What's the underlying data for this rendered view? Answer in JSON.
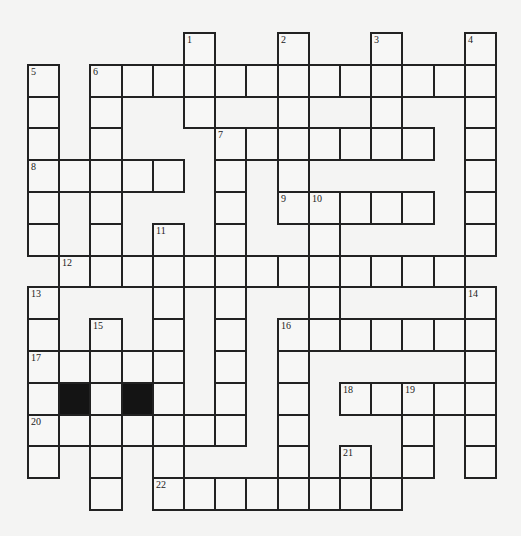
{
  "puzzle": {
    "type": "crossword",
    "origin": {
      "x": 28,
      "y": 33
    },
    "cell_size": {
      "w": 31.2,
      "h": 31.8
    },
    "cols": 15,
    "rows": 15,
    "colors": {
      "line": "#222222",
      "cell": "#f7f7f6",
      "black": "#141414",
      "background": "#f4f4f3"
    },
    "cells": [
      {
        "r": 0,
        "c": 5,
        "n": "1"
      },
      {
        "r": 0,
        "c": 8,
        "n": "2"
      },
      {
        "r": 0,
        "c": 11,
        "n": "3"
      },
      {
        "r": 0,
        "c": 14,
        "n": "4"
      },
      {
        "r": 1,
        "c": 0,
        "n": "5"
      },
      {
        "r": 1,
        "c": 2,
        "n": "6"
      },
      {
        "r": 1,
        "c": 3
      },
      {
        "r": 1,
        "c": 4
      },
      {
        "r": 1,
        "c": 5
      },
      {
        "r": 1,
        "c": 6
      },
      {
        "r": 1,
        "c": 7
      },
      {
        "r": 1,
        "c": 8
      },
      {
        "r": 1,
        "c": 9
      },
      {
        "r": 1,
        "c": 10
      },
      {
        "r": 1,
        "c": 11
      },
      {
        "r": 1,
        "c": 12
      },
      {
        "r": 1,
        "c": 13
      },
      {
        "r": 1,
        "c": 14
      },
      {
        "r": 2,
        "c": 0
      },
      {
        "r": 2,
        "c": 2
      },
      {
        "r": 2,
        "c": 5
      },
      {
        "r": 2,
        "c": 8
      },
      {
        "r": 2,
        "c": 11
      },
      {
        "r": 2,
        "c": 14
      },
      {
        "r": 3,
        "c": 0
      },
      {
        "r": 3,
        "c": 2
      },
      {
        "r": 3,
        "c": 6,
        "n": "7"
      },
      {
        "r": 3,
        "c": 7
      },
      {
        "r": 3,
        "c": 8
      },
      {
        "r": 3,
        "c": 9
      },
      {
        "r": 3,
        "c": 10
      },
      {
        "r": 3,
        "c": 11
      },
      {
        "r": 3,
        "c": 12
      },
      {
        "r": 3,
        "c": 14
      },
      {
        "r": 4,
        "c": 0,
        "n": "8"
      },
      {
        "r": 4,
        "c": 1
      },
      {
        "r": 4,
        "c": 2
      },
      {
        "r": 4,
        "c": 3
      },
      {
        "r": 4,
        "c": 4
      },
      {
        "r": 4,
        "c": 6
      },
      {
        "r": 4,
        "c": 8
      },
      {
        "r": 4,
        "c": 14
      },
      {
        "r": 5,
        "c": 0
      },
      {
        "r": 5,
        "c": 2
      },
      {
        "r": 5,
        "c": 6
      },
      {
        "r": 5,
        "c": 8,
        "n": "9"
      },
      {
        "r": 5,
        "c": 9,
        "n": "10"
      },
      {
        "r": 5,
        "c": 10
      },
      {
        "r": 5,
        "c": 11
      },
      {
        "r": 5,
        "c": 12
      },
      {
        "r": 5,
        "c": 14
      },
      {
        "r": 6,
        "c": 0
      },
      {
        "r": 6,
        "c": 2
      },
      {
        "r": 6,
        "c": 4,
        "n": "11"
      },
      {
        "r": 6,
        "c": 6
      },
      {
        "r": 6,
        "c": 9
      },
      {
        "r": 6,
        "c": 14
      },
      {
        "r": 7,
        "c": 1,
        "n": "12"
      },
      {
        "r": 7,
        "c": 2
      },
      {
        "r": 7,
        "c": 3
      },
      {
        "r": 7,
        "c": 4
      },
      {
        "r": 7,
        "c": 5
      },
      {
        "r": 7,
        "c": 6
      },
      {
        "r": 7,
        "c": 7
      },
      {
        "r": 7,
        "c": 8
      },
      {
        "r": 7,
        "c": 9
      },
      {
        "r": 7,
        "c": 10
      },
      {
        "r": 7,
        "c": 11
      },
      {
        "r": 7,
        "c": 12
      },
      {
        "r": 7,
        "c": 13
      },
      {
        "r": 8,
        "c": 0,
        "n": "13"
      },
      {
        "r": 8,
        "c": 4
      },
      {
        "r": 8,
        "c": 6
      },
      {
        "r": 8,
        "c": 9
      },
      {
        "r": 8,
        "c": 14,
        "n": "14"
      },
      {
        "r": 9,
        "c": 0
      },
      {
        "r": 9,
        "c": 2,
        "n": "15"
      },
      {
        "r": 9,
        "c": 4
      },
      {
        "r": 9,
        "c": 6
      },
      {
        "r": 9,
        "c": 8,
        "n": "16"
      },
      {
        "r": 9,
        "c": 9
      },
      {
        "r": 9,
        "c": 10
      },
      {
        "r": 9,
        "c": 11
      },
      {
        "r": 9,
        "c": 12
      },
      {
        "r": 9,
        "c": 13
      },
      {
        "r": 9,
        "c": 14
      },
      {
        "r": 10,
        "c": 0,
        "n": "17"
      },
      {
        "r": 10,
        "c": 1
      },
      {
        "r": 10,
        "c": 2
      },
      {
        "r": 10,
        "c": 3
      },
      {
        "r": 10,
        "c": 4
      },
      {
        "r": 10,
        "c": 6
      },
      {
        "r": 10,
        "c": 8
      },
      {
        "r": 10,
        "c": 14
      },
      {
        "r": 11,
        "c": 0
      },
      {
        "r": 11,
        "c": 1,
        "black": true
      },
      {
        "r": 11,
        "c": 2
      },
      {
        "r": 11,
        "c": 3,
        "black": true
      },
      {
        "r": 11,
        "c": 4
      },
      {
        "r": 11,
        "c": 6
      },
      {
        "r": 11,
        "c": 8
      },
      {
        "r": 11,
        "c": 10,
        "n": "18"
      },
      {
        "r": 11,
        "c": 11
      },
      {
        "r": 11,
        "c": 12,
        "n": "19"
      },
      {
        "r": 11,
        "c": 13
      },
      {
        "r": 11,
        "c": 14
      },
      {
        "r": 12,
        "c": 0,
        "n": "20"
      },
      {
        "r": 12,
        "c": 1
      },
      {
        "r": 12,
        "c": 2
      },
      {
        "r": 12,
        "c": 3
      },
      {
        "r": 12,
        "c": 4
      },
      {
        "r": 12,
        "c": 5
      },
      {
        "r": 12,
        "c": 6
      },
      {
        "r": 12,
        "c": 8
      },
      {
        "r": 12,
        "c": 12
      },
      {
        "r": 12,
        "c": 14
      },
      {
        "r": 13,
        "c": 0
      },
      {
        "r": 13,
        "c": 2
      },
      {
        "r": 13,
        "c": 4
      },
      {
        "r": 13,
        "c": 8
      },
      {
        "r": 13,
        "c": 10,
        "n": "21"
      },
      {
        "r": 13,
        "c": 12
      },
      {
        "r": 13,
        "c": 14
      },
      {
        "r": 14,
        "c": 2
      },
      {
        "r": 14,
        "c": 4,
        "n": "22"
      },
      {
        "r": 14,
        "c": 5
      },
      {
        "r": 14,
        "c": 6
      },
      {
        "r": 14,
        "c": 7
      },
      {
        "r": 14,
        "c": 8
      },
      {
        "r": 14,
        "c": 9
      },
      {
        "r": 14,
        "c": 10
      },
      {
        "r": 14,
        "c": 11
      }
    ],
    "entries": {
      "across": [
        {
          "number": "6",
          "row": 1,
          "col": 2,
          "length": 13
        },
        {
          "number": "7",
          "row": 3,
          "col": 6,
          "length": 7
        },
        {
          "number": "8",
          "row": 4,
          "col": 0,
          "length": 5
        },
        {
          "number": "9",
          "row": 5,
          "col": 8,
          "length": 5
        },
        {
          "number": "12",
          "row": 7,
          "col": 1,
          "length": 13
        },
        {
          "number": "16",
          "row": 9,
          "col": 8,
          "length": 7
        },
        {
          "number": "17",
          "row": 10,
          "col": 0,
          "length": 5
        },
        {
          "number": "18",
          "row": 11,
          "col": 10,
          "length": 5
        },
        {
          "number": "20",
          "row": 12,
          "col": 0,
          "length": 7
        },
        {
          "number": "22",
          "row": 14,
          "col": 4,
          "length": 8
        }
      ],
      "down": [
        {
          "number": "1",
          "row": 0,
          "col": 5,
          "length": 3
        },
        {
          "number": "2",
          "row": 0,
          "col": 8,
          "length": 6
        },
        {
          "number": "3",
          "row": 0,
          "col": 11,
          "length": 4
        },
        {
          "number": "4",
          "row": 0,
          "col": 14,
          "length": 7
        },
        {
          "number": "5",
          "row": 1,
          "col": 0,
          "length": 6
        },
        {
          "number": "6",
          "row": 1,
          "col": 2,
          "length": 7
        },
        {
          "number": "7",
          "row": 3,
          "col": 6,
          "length": 10
        },
        {
          "number": "10",
          "row": 5,
          "col": 9,
          "length": 5
        },
        {
          "number": "11",
          "row": 6,
          "col": 4,
          "length": 9
        },
        {
          "number": "13",
          "row": 8,
          "col": 0,
          "length": 6
        },
        {
          "number": "14",
          "row": 8,
          "col": 14,
          "length": 6
        },
        {
          "number": "15",
          "row": 9,
          "col": 2,
          "length": 6
        },
        {
          "number": "16",
          "row": 9,
          "col": 8,
          "length": 6
        },
        {
          "number": "19",
          "row": 11,
          "col": 12,
          "length": 3
        },
        {
          "number": "21",
          "row": 13,
          "col": 10,
          "length": 2
        }
      ]
    }
  }
}
